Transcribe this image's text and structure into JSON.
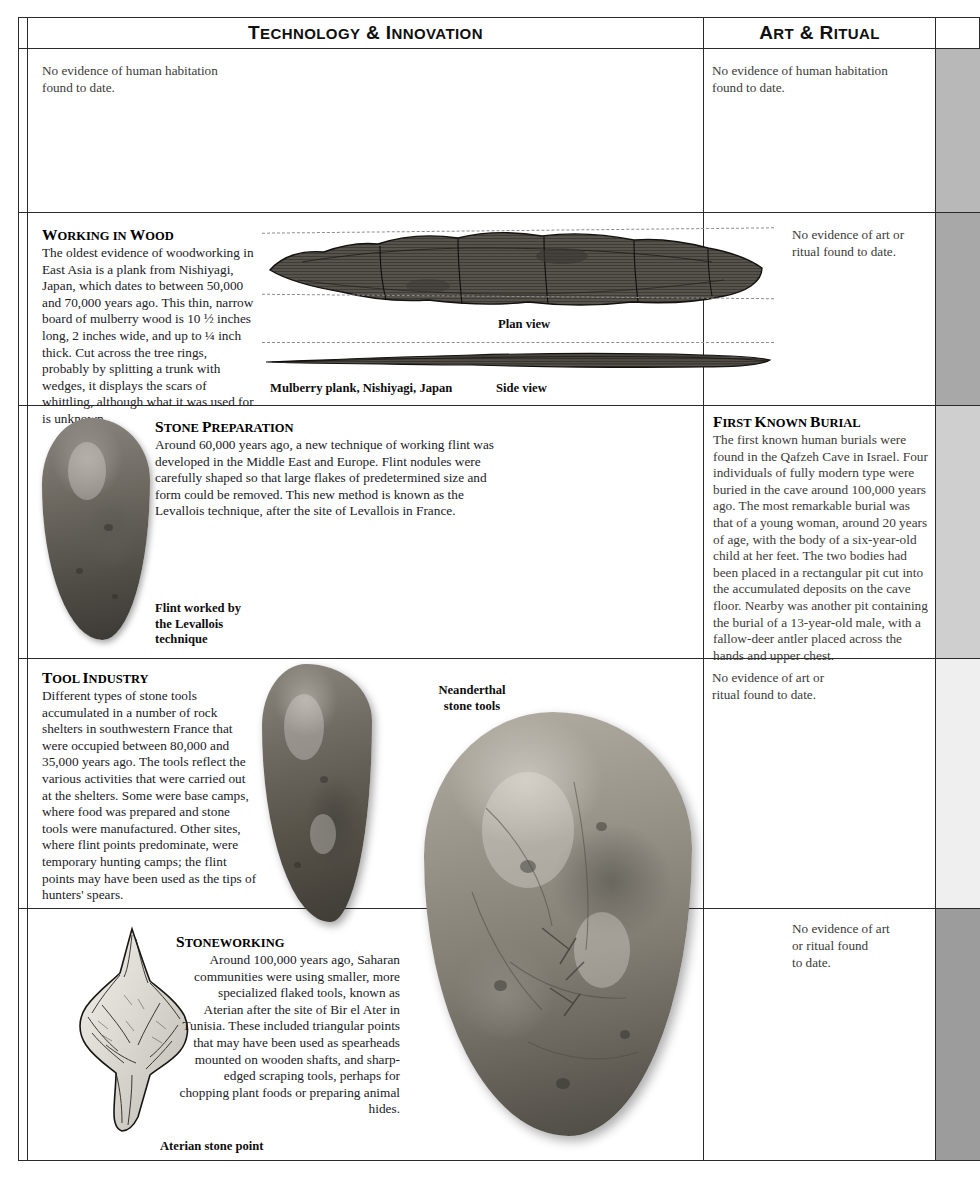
{
  "page": {
    "columns": [
      {
        "id": "technology",
        "title_lead": "T",
        "title_rest": "ECHNOLOGY",
        "title_amp": " & ",
        "title_lead2": "I",
        "title_rest2": "NNOVATION",
        "title_plain": "Technology & Innovation"
      },
      {
        "id": "art",
        "title_lead": "A",
        "title_rest": "RT",
        "title_amp": " & ",
        "title_lead2": "R",
        "title_rest2": "ITUAL",
        "title_plain": "Art & Ritual"
      }
    ]
  },
  "rows": [
    {
      "id": "row-1",
      "technology": {
        "note": "No evidence of human habitation\nfound to date."
      },
      "art": {
        "note": "No evidence of human habitation\nfound to date."
      },
      "swatch_color": "#b8b8b8"
    },
    {
      "id": "row-2",
      "technology": {
        "heading_cap": "W",
        "heading_rest": "ORKING IN ",
        "heading_cap2": "W",
        "heading_rest2": "OOD",
        "heading_plain": "Working in Wood",
        "body": "The oldest evidence of woodworking in East Asia is a plank from Nishiyagi, Japan, which dates to between 50,000 and 70,000 years ago. This thin, narrow board of mulberry wood is 10 ½ inches long, 2 inches wide, and up to ¼ inch thick. Cut across the tree rings, probably by splitting a trunk with wedges, it displays the scars of whittling, although what it was used for is unknown.",
        "figure_caption": "Mulberry plank, Nishiyagi, Japan",
        "view_label_plan": "Plan view",
        "view_label_side": "Side view"
      },
      "art": {
        "note": "No evidence of art or\nritual found to date."
      },
      "swatch_color": "#a8a8a8"
    },
    {
      "id": "row-3",
      "technology": {
        "heading_cap": "S",
        "heading_rest": "TONE ",
        "heading_cap2": "P",
        "heading_rest2": "REPARATION",
        "heading_plain": "Stone Preparation",
        "body": "Around 60,000 years ago, a new technique of working flint was developed in the Middle East and Europe. Flint nodules were carefully shaped so that large flakes of predetermined size and form could be removed. This new method is known as the Levallois technique, after the site of Levallois in France.",
        "figure_caption": "Flint worked by\nthe Levallois\ntechnique"
      },
      "art": {
        "heading_cap": "F",
        "heading_rest": "IRST ",
        "heading_cap2": "K",
        "heading_rest2": "NOWN ",
        "heading_cap3": "B",
        "heading_rest3": "URIAL",
        "heading_plain": "First Known Burial",
        "body": "The first known human burials were found in the Qafzeh Cave in Israel. Four individuals of fully modern type were buried in the cave around 100,000 years ago. The most remarkable burial was that of a young woman, around 20 years of age, with the body of a six-year-old child at her feet. The two bodies had been placed in a rectangular pit cut into the accumulated deposits on the cave floor. Nearby was another pit containing the burial of a 13-year-old male, with a fallow-deer antler placed across the hands and upper chest."
      },
      "swatch_color": "#cfcfcf"
    },
    {
      "id": "row-4",
      "technology": {
        "heading_cap": "T",
        "heading_rest": "OOL ",
        "heading_cap2": "I",
        "heading_rest2": "NDUSTRY",
        "heading_plain": "Tool Industry",
        "body": "Different types of stone tools accumulated in a number of rock shelters in southwestern France that were occupied between 80,000 and 35,000 years ago. The tools reflect the various activities that were carried out at the shelters. Some were base camps, where food was prepared and stone tools were manufactured. Other sites, where flint points predominate, were temporary hunting camps; the flint points may have been used as the tips of hunters' spears.",
        "figure_caption": "Neanderthal\nstone tools"
      },
      "art": {
        "note": "No evidence of art or\nritual found to date."
      },
      "swatch_color": "#efefef"
    },
    {
      "id": "row-5",
      "technology": {
        "heading_cap": "S",
        "heading_rest": "TONEWORKING",
        "heading_plain": "Stoneworking",
        "body": "Around 100,000 years ago, Saharan communities were using smaller, more specialized flaked tools, known as Aterian after the site of Bir el Ater in Tunisia. These included triangular points that may have been used as spearheads mounted on wooden shafts, and sharp-edged scraping tools, perhaps for chopping plant foods or preparing animal hides.",
        "figure_caption": "Aterian stone point"
      },
      "art": {
        "note": "No evidence of art\nor ritual found\nto date."
      },
      "swatch_color": "#9c9c9c"
    }
  ]
}
